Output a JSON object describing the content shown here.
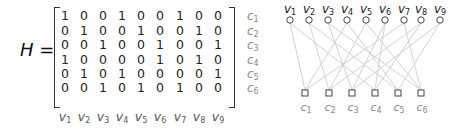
{
  "matrix": {
    "name": "H",
    "equals": "=",
    "rows": [
      [
        1,
        0,
        0,
        1,
        0,
        0,
        1,
        0,
        0
      ],
      [
        0,
        1,
        0,
        0,
        1,
        0,
        0,
        1,
        0
      ],
      [
        0,
        0,
        1,
        0,
        0,
        1,
        0,
        0,
        1
      ],
      [
        1,
        0,
        0,
        0,
        0,
        1,
        0,
        1,
        0
      ],
      [
        0,
        1,
        0,
        1,
        0,
        0,
        0,
        0,
        1
      ],
      [
        0,
        0,
        1,
        0,
        1,
        0,
        1,
        0,
        0
      ]
    ],
    "row_labels": [
      {
        "base": "c",
        "sub": "1"
      },
      {
        "base": "c",
        "sub": "2"
      },
      {
        "base": "c",
        "sub": "3"
      },
      {
        "base": "c",
        "sub": "4"
      },
      {
        "base": "c",
        "sub": "5"
      },
      {
        "base": "c",
        "sub": "6"
      }
    ],
    "col_labels": [
      {
        "base": "v",
        "sub": "1"
      },
      {
        "base": "v",
        "sub": "2"
      },
      {
        "base": "v",
        "sub": "3"
      },
      {
        "base": "v",
        "sub": "4"
      },
      {
        "base": "v",
        "sub": "5"
      },
      {
        "base": "v",
        "sub": "6"
      },
      {
        "base": "v",
        "sub": "7"
      },
      {
        "base": "v",
        "sub": "8"
      },
      {
        "base": "v",
        "sub": "9"
      }
    ]
  },
  "graph": {
    "variable_nodes": [
      "v1",
      "v2",
      "v3",
      "v4",
      "v5",
      "v6",
      "v7",
      "v8",
      "v9"
    ],
    "check_nodes": [
      "c1",
      "c2",
      "c3",
      "c4",
      "c5",
      "c6"
    ],
    "variable_node_shape": "circle",
    "check_node_shape": "square",
    "edge_color": "#cccccc",
    "node_color": "#444444"
  }
}
